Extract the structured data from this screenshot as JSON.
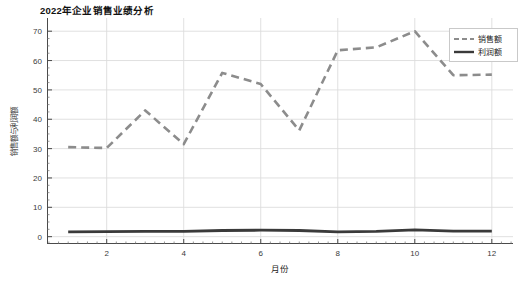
{
  "chart_data": {
    "type": "line",
    "title": "2022年企业销售业绩分析",
    "xlabel": "月份",
    "ylabel": "销售额与利润额",
    "x": [
      1,
      2,
      3,
      4,
      5,
      6,
      7,
      8,
      9,
      10,
      11,
      12
    ],
    "categories": [
      "1",
      "2",
      "3",
      "4",
      "5",
      "6",
      "7",
      "8",
      "9",
      "10",
      "11",
      "12"
    ],
    "series": [
      {
        "name": "销售额",
        "style": "dashed",
        "color": "#8c8c8c",
        "values": [
          30.5,
          30.2,
          43.0,
          31.5,
          55.8,
          52.0,
          36.2,
          63.5,
          64.5,
          70.0,
          55.0,
          55.2
        ]
      },
      {
        "name": "利润额",
        "style": "solid",
        "color": "#3a3a3a",
        "values": [
          1.6,
          1.7,
          1.8,
          1.8,
          2.1,
          2.2,
          2.1,
          1.6,
          1.8,
          2.3,
          1.9,
          1.9
        ]
      }
    ],
    "xlim": [
      0.45,
      12.55
    ],
    "ylim": [
      -2.5,
      74.5
    ],
    "xticks": [
      2,
      4,
      6,
      8,
      10,
      12
    ],
    "xtick_labels": [
      "2",
      "4",
      "6",
      "8",
      "10",
      "12"
    ],
    "yticks": [
      0,
      10,
      20,
      30,
      40,
      50,
      60,
      70
    ],
    "ytick_labels": [
      "0",
      "10",
      "20",
      "30",
      "40",
      "50",
      "60",
      "70"
    ],
    "grid": true,
    "grid_color": "#dcdcdc",
    "legend_position": "upper right",
    "legend_entries": [
      "销售额",
      "利润额"
    ],
    "background": "#ffffff"
  }
}
